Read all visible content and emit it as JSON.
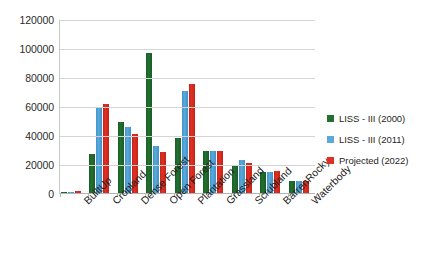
{
  "chart_data": {
    "type": "bar",
    "title": "",
    "subtitle": "",
    "xlabel": "",
    "ylabel": "",
    "ylim": [
      0,
      120000
    ],
    "ytick_step": 20000,
    "yticks": [
      0,
      20000,
      40000,
      60000,
      80000,
      100000,
      120000
    ],
    "ytick_labels": [
      "0",
      "20000",
      "40000",
      "60000",
      "80000",
      "100000",
      "120000"
    ],
    "grid": true,
    "legend_position": "right",
    "categories": [
      "BuiltUp",
      "Cropland",
      "Dense Forest",
      "Open Forest",
      "Plantation",
      "Grassland",
      "Scrubland",
      "BarrenRocky",
      "Waterbody"
    ],
    "series": [
      {
        "name": "LISS - III (2000)",
        "color": "#23702f",
        "values": [
          1200,
          27500,
          50000,
          97500,
          38500,
          29500,
          19000,
          15500,
          9000
        ]
      },
      {
        "name": "LISS - III (2011)",
        "color": "#5aa9da",
        "values": [
          1300,
          59000,
          46000,
          33000,
          71000,
          29500,
          23500,
          15000,
          9000
        ]
      },
      {
        "name": "Projected (2022)",
        "color": "#e03023",
        "values": [
          1800,
          62000,
          41500,
          29000,
          76000,
          30000,
          21500,
          16000,
          9000
        ]
      }
    ]
  }
}
